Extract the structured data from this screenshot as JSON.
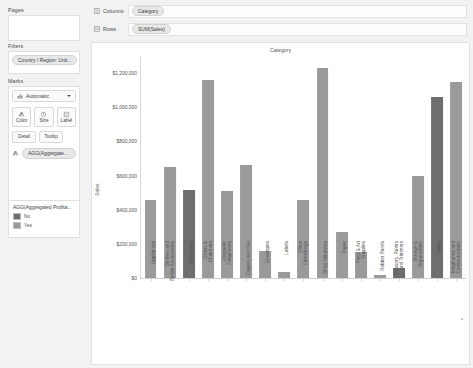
{
  "sidebar": {
    "pages": {
      "title": "Pages",
      "icon": "pages-shelf-icon"
    },
    "filters": {
      "title": "Filters",
      "pill": "Country / Region: Unit..."
    },
    "marks": {
      "title": "Marks",
      "mark_type": "Automatic",
      "mark_type_icon": "bar-mark-icon",
      "buttons": [
        {
          "label": "Color",
          "icon": "color-palette-icon"
        },
        {
          "label": "Size",
          "icon": "size-circle-icon"
        },
        {
          "label": "Label",
          "icon": "label-tag-icon"
        }
      ],
      "buttons2": [
        {
          "label": "Detail",
          "icon": "detail-icon"
        },
        {
          "label": "Tooltip",
          "icon": "tooltip-icon"
        }
      ],
      "encoding_pill": "AGG(Aggregated ...",
      "encoding_icon": "color-palette-icon"
    },
    "legend": {
      "title": "AGG(Aggregated Profita...",
      "items": [
        {
          "label": "No",
          "color": "#6e6e6e"
        },
        {
          "label": "Yes",
          "color": "#9a9a9a"
        }
      ]
    }
  },
  "shelves": [
    {
      "name": "Columns",
      "icon": "columns-shelf-icon",
      "value": "Category"
    },
    {
      "name": "Rows",
      "icon": "rows-shelf-icon",
      "value": "SUM(Sales)"
    }
  ],
  "colors": {
    "bar_profitable": "#9a9a9a",
    "bar_unprofitable": "#6e6e6e",
    "pane_background": "#ffffff",
    "app_background": "#f2f2f2"
  },
  "chart_data": {
    "type": "bar",
    "title": "Category",
    "xlabel": "Category",
    "ylabel": "Sales",
    "ylim": [
      0,
      1300000
    ],
    "grid": false,
    "legend": "AGG(Aggregated Profita...",
    "ytick_labels": [
      "$0",
      "$200,000",
      "$400,000",
      "$600,000",
      "$800,000",
      "$1,000,000",
      "$1,200,000"
    ],
    "ytick_values": [
      0,
      200000,
      400000,
      600000,
      800000,
      1000000,
      1200000
    ],
    "categories": [
      "Appliances",
      "Binders and Binder Accessories",
      "Bookcases",
      "Chairs & Chairmats",
      "Computer Peripherals",
      "Copiers and Fax",
      "Envelopes",
      "Labels",
      "Office Furnishings",
      "Office Machines",
      "Paper",
      "Pens & Art Supplies",
      "Rubber Bands",
      "Scissors, Rulers and Trimmers",
      "Storage & Organization",
      "Tables",
      "Telephones and Communication"
    ],
    "values": [
      456000,
      650000,
      515000,
      1160000,
      510000,
      660000,
      160000,
      35000,
      455000,
      1230000,
      270000,
      155000,
      15000,
      60000,
      600000,
      1060000,
      1150000
    ],
    "profitable": [
      "Yes",
      "Yes",
      "No",
      "Yes",
      "Yes",
      "Yes",
      "Yes",
      "Yes",
      "Yes",
      "Yes",
      "Yes",
      "Yes",
      "Yes",
      "No",
      "Yes",
      "No",
      "Yes"
    ],
    "series": [
      {
        "name": "SUM(Sales)",
        "values": [
          456000,
          650000,
          515000,
          1160000,
          510000,
          660000,
          160000,
          35000,
          455000,
          1230000,
          270000,
          155000,
          15000,
          60000,
          600000,
          1060000,
          1150000
        ]
      }
    ]
  }
}
